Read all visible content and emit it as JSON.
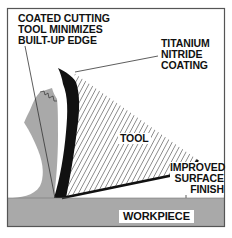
{
  "diagram": {
    "type": "technical-illustration",
    "labels": {
      "coated_line1": "COATED CUTTING",
      "coated_line2": "TOOL MINIMIZES",
      "coated_line3": "BUILT-UP EDGE",
      "tin_line1": "TITANIUM",
      "tin_line2": "NITRIDE",
      "tin_line3": "COATING",
      "tool": "TOOL",
      "surface_line1": "IMPROVED",
      "surface_line2": "SURFACE",
      "surface_line3": "FINISH",
      "workpiece": "WORKPIECE"
    },
    "colors": {
      "frame": "#555555",
      "workpiece": "#a9a9a9",
      "chip": "#a9a9a9",
      "coating": "#111111",
      "hatch": "#333333",
      "background": "#ffffff"
    },
    "parts": [
      "workpiece",
      "chip",
      "titanium-nitride-coating",
      "tool",
      "leader-lines"
    ]
  }
}
